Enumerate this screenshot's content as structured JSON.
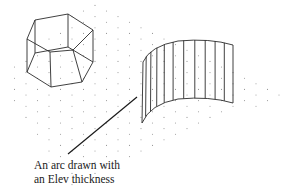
{
  "figure": {
    "caption_lines": [
      "An arc drawn with",
      "an Elev thickness"
    ],
    "objects": [
      {
        "name": "hexagonal-prism",
        "description": "Wireframe hexagonal prism"
      },
      {
        "name": "extruded-arc",
        "description": "Arc with Elev thickness shown as curved surface"
      }
    ],
    "grid": "isometric-dot-grid"
  },
  "colors": {
    "line": "#2b2b2b",
    "grid_dot": "#9a9a9a",
    "background": "#ffffff",
    "text": "#1a1a1a"
  }
}
